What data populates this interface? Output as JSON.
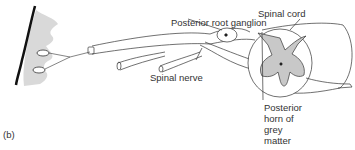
{
  "figure": {
    "panel_label": "(b)",
    "labels": {
      "posterior_root_ganglion": "Posterior root ganglion",
      "spinal_cord": "Spinal cord",
      "spinal_nerve": "Spinal nerve",
      "posterior_horn_line1": "Posterior",
      "posterior_horn_line2": "horn of",
      "posterior_horn_line3": "grey",
      "posterior_horn_line4": "matter"
    },
    "colors": {
      "skin_shade": "#d9d9d9",
      "grey_matter": "#c8c8c8",
      "line": "#333333"
    }
  }
}
